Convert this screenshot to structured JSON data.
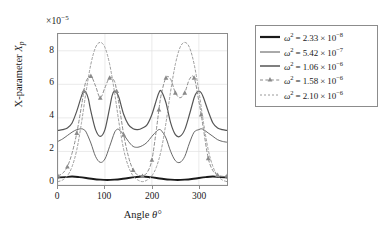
{
  "chart_data": {
    "type": "line",
    "title": "",
    "xlabel": "Angle θ°",
    "ylabel": "X-parameter X_p",
    "y_multiplier": "×10⁻⁵",
    "xlim": [
      0,
      360
    ],
    "ylim": [
      0,
      9
    ],
    "xticks": [
      0,
      100,
      200,
      300
    ],
    "yticks": [
      0,
      2,
      4,
      6,
      8
    ],
    "grid": true,
    "legend_position": "right-outside",
    "series": [
      {
        "name": "ω² = 2.33 × 10⁻⁸",
        "style": "solid-thick",
        "color": "#1a1a1a",
        "x": [
          0,
          15,
          30,
          45,
          60,
          75,
          90,
          105,
          120,
          135,
          150,
          165,
          180,
          195,
          210,
          225,
          240,
          255,
          270,
          285,
          300,
          315,
          330,
          345,
          360
        ],
        "values": [
          0.45,
          0.47,
          0.5,
          0.47,
          0.42,
          0.36,
          0.32,
          0.3,
          0.32,
          0.36,
          0.42,
          0.47,
          0.5,
          0.47,
          0.42,
          0.36,
          0.32,
          0.3,
          0.32,
          0.36,
          0.42,
          0.47,
          0.5,
          0.47,
          0.45
        ]
      },
      {
        "name": "ω² = 5.42 × 10⁻⁷",
        "style": "solid-thin",
        "color": "#555555",
        "x": [
          0,
          10,
          20,
          30,
          40,
          50,
          55,
          60,
          70,
          80,
          90,
          100,
          110,
          120,
          125,
          130,
          140,
          150,
          160,
          170,
          180,
          190,
          200,
          210,
          215,
          220,
          230,
          240,
          250,
          260,
          270,
          280,
          290,
          300,
          305,
          310,
          320,
          330,
          340,
          350,
          360
        ],
        "values": [
          2.6,
          2.75,
          2.95,
          3.15,
          3.3,
          3.35,
          3.3,
          3.15,
          2.5,
          1.7,
          1.35,
          1.55,
          2.3,
          3.1,
          3.3,
          3.3,
          3.0,
          2.6,
          2.3,
          2.25,
          2.35,
          2.55,
          2.9,
          3.2,
          3.3,
          3.25,
          2.8,
          2.0,
          1.45,
          1.35,
          1.7,
          2.5,
          3.15,
          3.3,
          3.35,
          3.3,
          3.1,
          2.9,
          2.7,
          2.6,
          2.55
        ]
      },
      {
        "name": "ω² = 1.06 × 10⁻⁶",
        "style": "solid-med",
        "color": "#555555",
        "x": [
          0,
          10,
          20,
          30,
          40,
          50,
          55,
          60,
          65,
          70,
          80,
          90,
          100,
          110,
          115,
          120,
          125,
          130,
          140,
          150,
          160,
          170,
          180,
          190,
          200,
          210,
          215,
          220,
          230,
          240,
          250,
          260,
          270,
          280,
          290,
          295,
          300,
          305,
          310,
          320,
          330,
          340,
          350,
          360
        ],
        "values": [
          3.25,
          3.3,
          3.4,
          3.7,
          4.4,
          5.3,
          5.6,
          5.5,
          5.1,
          4.4,
          3.3,
          2.9,
          3.3,
          4.6,
          5.3,
          5.6,
          5.5,
          5.2,
          4.2,
          3.6,
          3.35,
          3.3,
          3.4,
          3.6,
          4.2,
          5.1,
          5.5,
          5.6,
          4.9,
          3.7,
          3.0,
          2.9,
          3.3,
          4.2,
          5.2,
          5.5,
          5.6,
          5.5,
          5.2,
          4.4,
          3.7,
          3.4,
          3.3,
          3.25
        ]
      },
      {
        "name": "ω² = 1.58 × 10⁻⁶",
        "style": "dashed-marker",
        "marker": "triangle",
        "color": "#8a8a8a",
        "x": [
          0,
          10,
          20,
          30,
          40,
          50,
          55,
          60,
          70,
          80,
          90,
          100,
          110,
          120,
          125,
          130,
          140,
          150,
          160,
          170,
          180,
          190,
          200,
          210,
          215,
          220,
          230,
          240,
          250,
          260,
          270,
          280,
          290,
          300,
          305,
          310,
          320,
          330,
          340,
          350,
          360
        ],
        "values": [
          0.55,
          0.7,
          1.1,
          1.9,
          3.1,
          4.7,
          5.6,
          6.2,
          6.5,
          5.9,
          5.2,
          5.8,
          6.4,
          6.2,
          5.6,
          4.8,
          3.0,
          1.7,
          0.9,
          0.6,
          0.55,
          0.75,
          1.5,
          3.4,
          4.5,
          5.4,
          6.4,
          6.3,
          5.5,
          5.2,
          5.5,
          6.3,
          6.4,
          5.0,
          4.2,
          3.3,
          1.6,
          0.85,
          0.6,
          0.52,
          0.55
        ]
      },
      {
        "name": "ω² = 2.10 × 10⁻⁶",
        "style": "dashed-fine",
        "color": "#9a9a9a",
        "x": [
          0,
          10,
          20,
          30,
          40,
          50,
          60,
          70,
          80,
          90,
          100,
          110,
          120,
          130,
          140,
          150,
          160,
          170,
          180,
          190,
          200,
          210,
          220,
          230,
          240,
          250,
          260,
          270,
          280,
          290,
          300,
          310,
          320,
          330,
          340,
          350,
          360
        ],
        "values": [
          0.2,
          0.3,
          0.55,
          1.1,
          2.1,
          3.7,
          5.6,
          7.2,
          8.2,
          8.5,
          8.2,
          7.2,
          5.6,
          3.7,
          2.1,
          1.1,
          0.55,
          0.3,
          0.2,
          0.3,
          0.55,
          1.1,
          2.1,
          3.7,
          5.6,
          7.2,
          8.2,
          8.5,
          8.2,
          7.2,
          5.6,
          3.7,
          2.1,
          1.1,
          0.55,
          0.3,
          0.2
        ]
      }
    ]
  },
  "axis": {
    "multiplier_base": "×10",
    "multiplier_exp": "−5",
    "ylabel_main": "X-parameter ",
    "ylabel_sym": "X",
    "ylabel_sub": "p",
    "xlabel_main": "Angle ",
    "xlabel_sym": "θ°",
    "xticks": [
      "0",
      "100",
      "200",
      "300"
    ],
    "yticks": [
      "8",
      "6",
      "4",
      "2",
      "0"
    ]
  },
  "legend": {
    "entries": [
      {
        "sym": "ω",
        "eq": " = 2.33 × 10",
        "exp": "−8"
      },
      {
        "sym": "ω",
        "eq": " = 5.42 × 10",
        "exp": "−7"
      },
      {
        "sym": "ω",
        "eq": " = 1.06 × 10",
        "exp": "−6"
      },
      {
        "sym": "ω",
        "eq": " = 1.58 × 10",
        "exp": "−6"
      },
      {
        "sym": "ω",
        "eq": " = 2.10 × 10",
        "exp": "−6"
      }
    ]
  },
  "colors": {
    "frame": "#8c8c8c",
    "grid": "#e2e2e2",
    "s1": "#1a1a1a",
    "s2": "#555555",
    "s3": "#555555",
    "s4": "#8a8a8a",
    "s5": "#9a9a9a"
  }
}
